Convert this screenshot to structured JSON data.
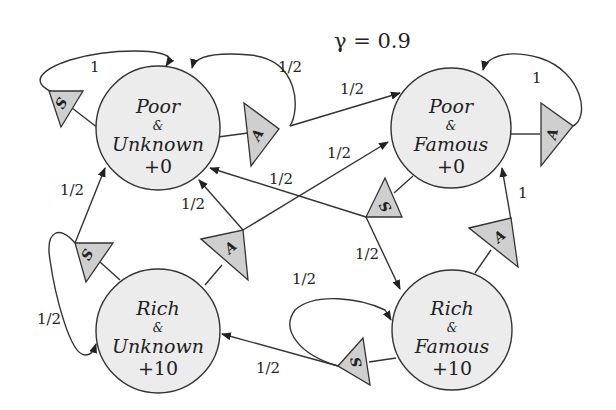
{
  "title": "γ = 0.9",
  "colors": {
    "state_fill": "#ececec",
    "action_fill": "#cfcfcf",
    "stroke": "#333333",
    "background": "#ffffff"
  },
  "states": [
    {
      "id": "PU",
      "line1": "Poor",
      "amp": "&",
      "line2": "Unknown",
      "reward": "+0"
    },
    {
      "id": "PF",
      "line1": "Poor",
      "amp": "&",
      "line2": "Famous",
      "reward": "+0"
    },
    {
      "id": "RU",
      "line1": "Rich",
      "amp": "&",
      "line2": "Unknown",
      "reward": "+10"
    },
    {
      "id": "RF",
      "line1": "Rich",
      "amp": "&",
      "line2": "Famous",
      "reward": "+10"
    }
  ],
  "actions": [
    {
      "from": "PU",
      "label": "S"
    },
    {
      "from": "PU",
      "label": "A"
    },
    {
      "from": "PF",
      "label": "A"
    },
    {
      "from": "PF",
      "label": "S"
    },
    {
      "from": "RU",
      "label": "S"
    },
    {
      "from": "RU",
      "label": "A"
    },
    {
      "from": "RF",
      "label": "A"
    },
    {
      "from": "RF",
      "label": "S"
    }
  ],
  "transitions": [
    {
      "from": "PU",
      "action": "S",
      "to": "PU",
      "prob": "1"
    },
    {
      "from": "PU",
      "action": "A",
      "to": "PU",
      "prob": "1/2"
    },
    {
      "from": "PU",
      "action": "A",
      "to": "PF",
      "prob": "1/2"
    },
    {
      "from": "PF",
      "action": "A",
      "to": "PF",
      "prob": "1"
    },
    {
      "from": "PF",
      "action": "S",
      "to": "PU",
      "prob": "1/2"
    },
    {
      "from": "PF",
      "action": "S",
      "to": "RF",
      "prob": "1/2"
    },
    {
      "from": "RU",
      "action": "S",
      "to": "PU",
      "prob": "1/2"
    },
    {
      "from": "RU",
      "action": "S",
      "to": "RU",
      "prob": "1/2"
    },
    {
      "from": "RU",
      "action": "A",
      "to": "PU",
      "prob": "1/2"
    },
    {
      "from": "RU",
      "action": "A",
      "to": "PF",
      "prob": "1/2"
    },
    {
      "from": "RF",
      "action": "A",
      "to": "PF",
      "prob": "1"
    },
    {
      "from": "RF",
      "action": "S",
      "to": "RF",
      "prob": "1/2"
    },
    {
      "from": "RF",
      "action": "S",
      "to": "RU",
      "prob": "1/2"
    }
  ]
}
